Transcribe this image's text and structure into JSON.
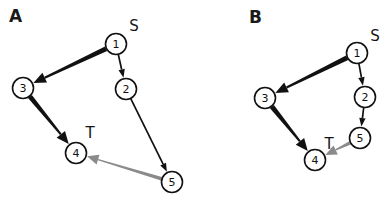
{
  "figure": {
    "width": 392,
    "height": 207,
    "background": "#ffffff"
  },
  "colors": {
    "node_stroke": "#111111",
    "node_fill": "#ffffff",
    "edge_black": "#111111",
    "edge_gray": "#8a8a8a",
    "label_text": "#1a1a1a"
  },
  "panels": [
    {
      "id": "A",
      "label": "A",
      "label_pos": {
        "x": 14,
        "y": 17
      },
      "nodes": [
        {
          "id": "1",
          "label": "1",
          "x": 116,
          "y": 44,
          "r": 10.5
        },
        {
          "id": "2",
          "label": "2",
          "x": 126,
          "y": 89,
          "r": 10.5
        },
        {
          "id": "3",
          "label": "3",
          "x": 23,
          "y": 88,
          "r": 10.5
        },
        {
          "id": "4",
          "label": "4",
          "x": 76,
          "y": 153,
          "r": 10.5
        },
        {
          "id": "5",
          "label": "5",
          "x": 172,
          "y": 182,
          "r": 10.5
        }
      ],
      "terminals": [
        {
          "id": "S",
          "label": "S",
          "x": 134,
          "y": 26
        },
        {
          "id": "T",
          "label": "T",
          "x": 90,
          "y": 133
        }
      ],
      "edges": [
        {
          "id": "A-1-3",
          "from": "1",
          "to": "3",
          "style": "thick",
          "color": "#111111",
          "width": 5.0
        },
        {
          "id": "A-1-2",
          "from": "1",
          "to": "2",
          "style": "thin",
          "color": "#111111",
          "width": 1.7
        },
        {
          "id": "A-2-5",
          "from": "2",
          "to": "5",
          "style": "thin",
          "color": "#111111",
          "width": 1.7
        },
        {
          "id": "A-3-4",
          "from": "3",
          "to": "4",
          "style": "thick",
          "color": "#111111",
          "width": 5.0
        },
        {
          "id": "A-5-4",
          "from": "5",
          "to": "4",
          "style": "gray",
          "color": "#8a8a8a",
          "width": 3.6
        }
      ]
    },
    {
      "id": "B",
      "label": "B",
      "label_pos": {
        "x": 254,
        "y": 18
      },
      "nodes": [
        {
          "id": "1",
          "label": "1",
          "x": 357,
          "y": 53,
          "r": 10.5
        },
        {
          "id": "2",
          "label": "2",
          "x": 365,
          "y": 97,
          "r": 10.5
        },
        {
          "id": "3",
          "label": "3",
          "x": 265,
          "y": 98,
          "r": 10.5
        },
        {
          "id": "4",
          "label": "4",
          "x": 315,
          "y": 160,
          "r": 10.5
        },
        {
          "id": "5",
          "label": "5",
          "x": 360,
          "y": 138,
          "r": 10.5
        }
      ],
      "terminals": [
        {
          "id": "S",
          "label": "S",
          "x": 375,
          "y": 36
        },
        {
          "id": "T",
          "label": "T",
          "x": 329,
          "y": 144
        }
      ],
      "edges": [
        {
          "id": "B-1-3",
          "from": "1",
          "to": "3",
          "style": "thick",
          "color": "#111111",
          "width": 5.0
        },
        {
          "id": "B-1-2",
          "from": "1",
          "to": "2",
          "style": "thin",
          "color": "#111111",
          "width": 1.7
        },
        {
          "id": "B-2-5",
          "from": "2",
          "to": "5",
          "style": "thin",
          "color": "#111111",
          "width": 1.7
        },
        {
          "id": "B-3-4",
          "from": "3",
          "to": "4",
          "style": "thick",
          "color": "#111111",
          "width": 5.0
        },
        {
          "id": "B-5-4",
          "from": "5",
          "to": "4",
          "style": "gray",
          "color": "#8a8a8a",
          "width": 3.6
        }
      ]
    }
  ]
}
